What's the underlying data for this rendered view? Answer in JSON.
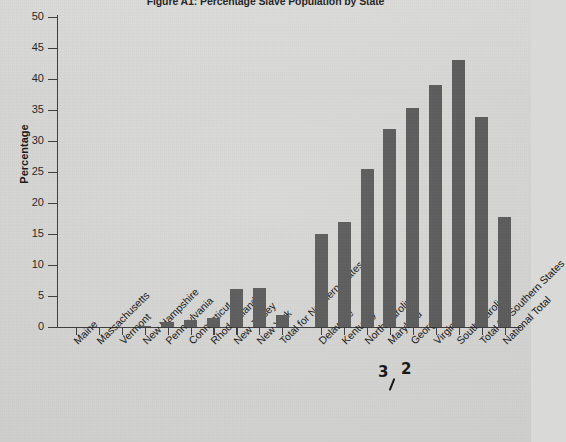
{
  "figure": {
    "title": "Figure A1: Percentage Slave Population by State",
    "background_color": "#d9d9d7",
    "bar_color": "#595959",
    "axis_color": "#3a3a3a"
  },
  "annotations": [
    {
      "name": "pen-digit-3",
      "text": "3",
      "x": 378,
      "y": 363
    },
    {
      "name": "pen-digit-2",
      "text": "2",
      "x": 401,
      "y": 360
    },
    {
      "name": "pen-stroke-1",
      "text": "",
      "x": 391,
      "y": 378
    }
  ],
  "chart_data": {
    "type": "bar",
    "title": "Figure A1: Percentage Slave Population by State",
    "xlabel": "",
    "ylabel": "Percentage",
    "ylim": [
      0,
      50
    ],
    "yticks": [
      0,
      5,
      10,
      15,
      20,
      25,
      30,
      35,
      40,
      45,
      50
    ],
    "ytick_labels": [
      "0",
      "5",
      "10",
      "15",
      "20",
      "25",
      "30",
      "35",
      "40",
      "45",
      "50"
    ],
    "grid": false,
    "legend": null,
    "categories": [
      "Maine",
      "Massachusetts",
      "Vermont",
      "New Hampshire",
      "Pennsylvania",
      "Connecticut",
      "Rhode Island",
      "New Jersey",
      "New York",
      "Total for Northern States",
      "Delaware",
      "Kentucky",
      "North Carolina",
      "Maryland",
      "Georgia",
      "Virginia",
      "South Carolina",
      "Total for Southern States",
      "National Total"
    ],
    "values": [
      0.0,
      0.0,
      0.0,
      0.1,
      0.8,
      1.2,
      1.5,
      6.2,
      6.3,
      2.0,
      15.0,
      17.0,
      25.5,
      32.0,
      35.3,
      39.0,
      43.0,
      33.9,
      17.7
    ]
  }
}
